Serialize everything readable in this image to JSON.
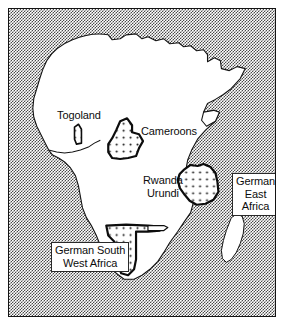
{
  "figure": {
    "kind": "historical-map",
    "frame": {
      "border_color": "#141414"
    },
    "ocean": {
      "fill_style": "stipple",
      "color": "#4a4a4a"
    },
    "land": {
      "name": "Africa",
      "fill": "#ffffff",
      "outline": "#141414"
    },
    "island": {
      "name": "Madagascar",
      "fill": "#ffffff",
      "outline": "#141414"
    }
  },
  "labels": {
    "togoland": {
      "text": "Togoland",
      "boxed": false
    },
    "cameroons": {
      "text": "Cameroons",
      "boxed": false
    },
    "rwanda": {
      "line1": "Rwanda",
      "line2": "Urundi",
      "boxed": false
    },
    "german_east_africa": {
      "line1": "German",
      "line2": "East",
      "line3": "Africa",
      "boxed": true
    },
    "german_south_west_africa": {
      "line1": "German South",
      "line2": "West Africa",
      "boxed": true
    }
  },
  "territories": [
    {
      "id": "togoland",
      "name": "Togoland",
      "fill": "dotted"
    },
    {
      "id": "cameroons",
      "name": "Cameroons",
      "fill": "dotted"
    },
    {
      "id": "german-east-africa",
      "name": "German East Africa",
      "fill": "dotted"
    },
    {
      "id": "german-south-west-africa",
      "name": "German South West Africa",
      "fill": "dotted"
    }
  ]
}
